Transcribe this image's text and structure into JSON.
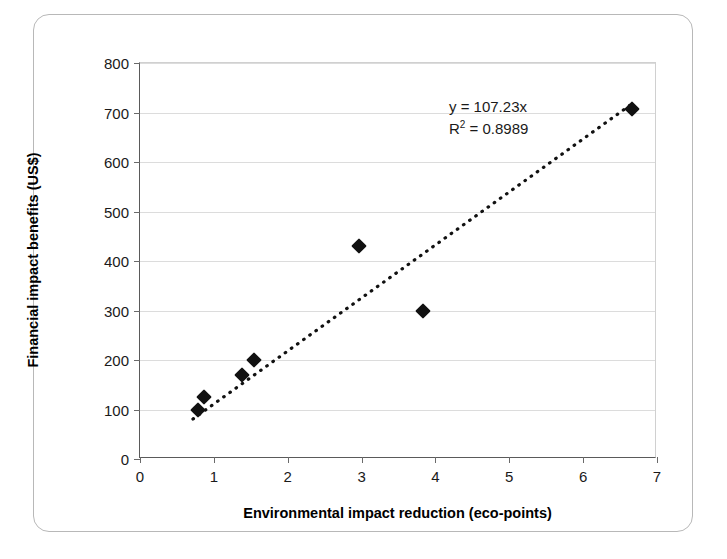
{
  "chart_data": {
    "type": "scatter",
    "title": "",
    "xlabel": "Environmental impact reduction (eco-points)",
    "ylabel": "Financial impact benefits  (US$)",
    "xlim": [
      0,
      7
    ],
    "ylim": [
      0,
      800
    ],
    "xticks": [
      "0",
      "1",
      "2",
      "3",
      "4",
      "5",
      "6",
      "7"
    ],
    "yticks": [
      "0",
      "100",
      "200",
      "300",
      "400",
      "500",
      "600",
      "700",
      "800"
    ],
    "grid": "horizontal",
    "legend": "none",
    "marker_style": "filled-diamond",
    "marker_color": "#111111",
    "points": [
      {
        "x": 0.78,
        "y": 100
      },
      {
        "x": 0.86,
        "y": 125
      },
      {
        "x": 1.38,
        "y": 170
      },
      {
        "x": 1.55,
        "y": 200
      },
      {
        "x": 2.97,
        "y": 430
      },
      {
        "x": 3.83,
        "y": 298
      },
      {
        "x": 6.66,
        "y": 707
      }
    ],
    "trendline": {
      "style": "dotted",
      "color": "#111111",
      "slope": 107.23,
      "intercept": 0,
      "x_start": 0.72,
      "x_end": 6.7,
      "equation": "y = 107.23x",
      "r_squared_prefix": "R",
      "r_squared_exponent": "2",
      "r_squared_value": " = 0.8989"
    }
  }
}
